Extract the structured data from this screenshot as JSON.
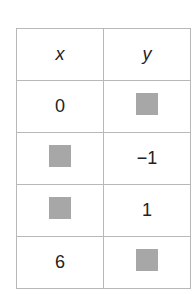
{
  "table": {
    "headers": [
      "x",
      "y"
    ],
    "rows": [
      {
        "x": "0",
        "y": null
      },
      {
        "x": null,
        "y": "−1"
      },
      {
        "x": null,
        "y": "1"
      },
      {
        "x": "6",
        "y": null
      }
    ],
    "blank_placeholder_color": "#b3b3b3"
  }
}
